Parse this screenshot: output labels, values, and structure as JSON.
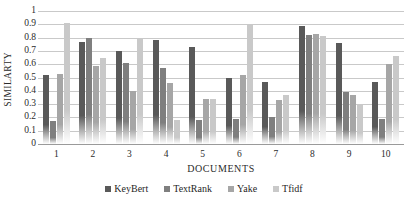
{
  "chart_data": {
    "type": "bar",
    "title": "",
    "xlabel": "DOCUMENTS",
    "ylabel": "SIMILARTY",
    "ylim": [
      0,
      1
    ],
    "ytick_step": 0.1,
    "grid": true,
    "legend_position": "bottom",
    "categories": [
      "1",
      "2",
      "3",
      "4",
      "5",
      "6",
      "7",
      "8",
      "9",
      "10"
    ],
    "ytick_labels": [
      "1",
      "0.9",
      "0.8",
      "0.7",
      "0.6",
      "0.5",
      "0.4",
      "0.3",
      "0.2",
      "0.1",
      "0"
    ],
    "series": [
      {
        "name": "KeyBert",
        "color": "#595959",
        "values": [
          0.52,
          0.77,
          0.7,
          0.78,
          0.73,
          0.5,
          0.47,
          0.89,
          0.76,
          0.47
        ]
      },
      {
        "name": "TextRank",
        "color": "#7f7f7f",
        "values": [
          0.17,
          0.8,
          0.61,
          0.57,
          0.18,
          0.19,
          0.2,
          0.82,
          0.39,
          0.19
        ]
      },
      {
        "name": "Yake",
        "color": "#a6a6a6",
        "values": [
          0.53,
          0.59,
          0.4,
          0.46,
          0.34,
          0.52,
          0.33,
          0.83,
          0.37,
          0.6
        ]
      },
      {
        "name": "Tfidf",
        "color": "#c9c9c9",
        "values": [
          0.91,
          0.65,
          0.8,
          0.18,
          0.34,
          0.9,
          0.37,
          0.81,
          0.3,
          0.66
        ]
      }
    ]
  }
}
